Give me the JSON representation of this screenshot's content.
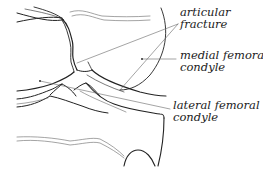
{
  "diagram": {
    "line_color": "#222222",
    "thin_line_color": "#555555",
    "labels": [
      {
        "id": "articular-fracture",
        "lines": [
          "articular",
          "fracture"
        ]
      },
      {
        "id": "medial-femoral-condyle",
        "lines": [
          "medial femoral",
          "condyle"
        ]
      },
      {
        "id": "lateral-femoral-condyle",
        "lines": [
          "lateral femoral",
          "condyle"
        ]
      }
    ]
  }
}
